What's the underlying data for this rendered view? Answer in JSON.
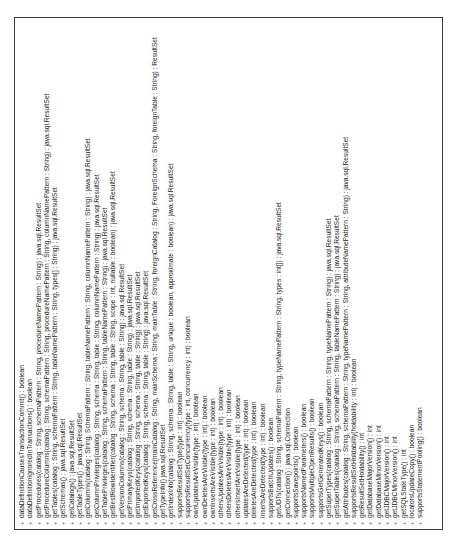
{
  "diagram": {
    "type": "uml-class-method-compartment",
    "orientation": "rotated-90-ccw",
    "colors": {
      "background": "#ffffff",
      "border": "#3a3a3a",
      "text": "#222222"
    },
    "visibility_symbol": "+",
    "methods": [
      "dataDefinitionCausesTransactionCommit() : boolean",
      "dataDefinitionIgnoredInTransactions() : boolean",
      "getProcedures(catalog : String, schemaPattern : String, procedureNamePattern : String) : java.sql.ResultSet",
      "getProcedureColumns(catalog : String, schemaPattern : String, procedureNamePattern : String, columnNamePattern : String) : java.sql.ResultSet",
      "getTables(catalog : String, schemaPattern : String, tableNamePattern : String, types[] : String) : java.sql.ResultSet",
      "getSchemas() : java.sql.ResultSet",
      "getCatalogs() : java.sql.ResultSet",
      "getTableTypes() : java.sql.ResultSet",
      "getColumns(catalog : String, SchemaPattern : String, tableNamePattern : String, columnNamePattern : String) : java.sql.ResultSet",
      "getColumnPrivileges(catalog : String, schema : String, table : String, columnNamePattern : String) : java.sql.ResultSet",
      "getTablePrivileges(catalog : String, schemaPattern : String, tableNamePattern : String) : java.sql.ResultSet",
      "getBestRowIdentifier(catalog : String, schema : String, table : String, scope : int, nullable : boolean) : java.sql.ResultSet",
      "getVersionColumns(catalog : String, schema : String, table : String) : java.sql.ResultSet",
      "getPrimaryKeys(catalog : String, schema : String, table : String) : java.sql.ResultSet",
      "getImportedKeys(catalog : String, schema : String, table : String) : java.sql.ResultSet",
      "getExportedKeys(catalog : String, schema : String, table : String) : java.sql.ResultSet",
      "getCrossReference(mainCatalog : String, mainSchema : String, mainTable : String, foreignCatalog : String, ForeignSchema : String, foreignTable : String) : ResultSet",
      "getTypeInfo() java.sql.ResultSet",
      "getIndexInfo(catalog : String, schema : String, table : String, unique : boolean, approximate : boolean) : java.sql.ResultSet",
      "supportsResultSetType(type : int) : boolean",
      "supportsResultSetConcurrency(type : int, concurrency : int) : boolean",
      "ownUpdatesAreVisible(type : int) : boolean",
      "ownDeletesAreVisible(type : int) : boolean",
      "ownInsertsAreVisible(type : int) : boolean",
      "othersUpdatesAreVisible(type : int) : boolean",
      "othersDeletesAreVisible(type : int) : boolean",
      "othersInsertAreVisible(type : int) : boolean",
      "updatesAreDetected(type : int) : boolean",
      "deletesAreDetected(type : int) : boolean",
      "insertsAreDetected(type : int) : boolean",
      "supportsBatchUpdates() : boolean",
      "getUDTs(catalog : String, schemaPattern : String, typeNamePattern : String, types : int[]) : java.sql.ResultSet",
      "getConnection() : java.sql.Connection",
      "supportsSavepoints() : boolean",
      "supportsNamedParameters() : boolean",
      "supportsMultipleOpenResults() : boolean",
      "supportsGetGeneratedKeys() : boolean",
      "getSuperTypes(catalog : String, schemaPattern : String, typeNamePattern : String) : java.sql.ResultSet",
      "getSuperTables(catalog : String, schemaPattern : String, tableNamePattern : String) : java.sql.ResultSet",
      "getAttributes(catalog : String, schemaPattern : String, typeNamePattern : String, attributeNamePattern : String) : java.sql.ResultSet",
      "supportsResultSetHoldability(holdability : int) : boolean",
      "getResultSetHoldability() : int",
      "getDatabaseMajorVersion() : int",
      "getDatabaseMinorVersion() : int",
      "getJDBCMajorVersion() : int",
      "getJDBCMinorVersion() : int",
      "getSQLStateType() : int",
      "locatorsUpdateCopy() : boolean",
      "supportsStatementPooling() : boolean"
    ]
  }
}
